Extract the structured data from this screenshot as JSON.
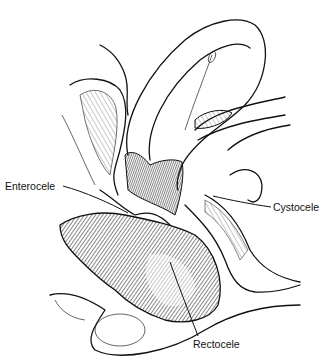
{
  "figure": {
    "type": "anatomical-illustration",
    "style": "black-and-white pen-and-ink line drawing",
    "colors": {
      "ink": "#111111",
      "background": "#ffffff"
    }
  },
  "labels": [
    {
      "id": "enterocele",
      "text": "Enterocele",
      "x": 5,
      "y": 181,
      "pointer_to": [
        128,
        213
      ]
    },
    {
      "id": "cystocele",
      "text": "Cystocele",
      "x": 273,
      "y": 202,
      "pointer_to": [
        213,
        196
      ]
    },
    {
      "id": "rectocele",
      "text": "Rectocele",
      "x": 193,
      "y": 339,
      "pointer_to": [
        170,
        262
      ]
    }
  ]
}
